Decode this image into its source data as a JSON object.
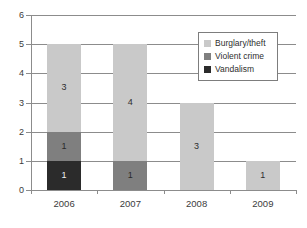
{
  "chart_data": {
    "type": "bar",
    "subtype": "stacked-bar",
    "title": "",
    "xlabel": "",
    "ylabel": "",
    "categories": [
      "2006",
      "2007",
      "2008",
      "2009"
    ],
    "series": [
      {
        "name": "Vandalism",
        "color": "#2b2b2b",
        "values": [
          1,
          0,
          0,
          0
        ]
      },
      {
        "name": "Violent crime",
        "color": "#7f7f7f",
        "values": [
          1,
          1,
          0,
          0
        ]
      },
      {
        "name": "Burglary/theft",
        "color": "#c9c9c9",
        "values": [
          3,
          4,
          3,
          1
        ]
      }
    ],
    "stack_order_bottom_to_top": [
      "Vandalism",
      "Violent crime",
      "Burglary/theft"
    ],
    "totals": [
      5,
      5,
      3,
      1
    ],
    "ylim": [
      0,
      6
    ],
    "yticks": [
      "0",
      "1",
      "2",
      "3",
      "4",
      "5",
      "6"
    ],
    "grid": true,
    "grid_axis": "y",
    "legend_position": "top-right",
    "data_labels": {
      "2006": [
        {
          "series": "Vandalism",
          "label": "1"
        },
        {
          "series": "Violent crime",
          "label": "1"
        },
        {
          "series": "Burglary/theft",
          "label": "3"
        }
      ],
      "2007": [
        {
          "series": "Violent crime",
          "label": "1"
        },
        {
          "series": "Burglary/theft",
          "label": "4"
        }
      ],
      "2008": [
        {
          "series": "Burglary/theft",
          "label": "3"
        }
      ],
      "2009": [
        {
          "series": "Burglary/theft",
          "label": "1"
        }
      ]
    }
  },
  "axes": {
    "y_labels": [
      "6",
      "5",
      "4",
      "3",
      "2",
      "1",
      "0"
    ],
    "x_labels": [
      "2006",
      "2007",
      "2008",
      "2009"
    ]
  },
  "legend": {
    "items": [
      {
        "label": "Burglary/theft",
        "color": "#c9c9c9"
      },
      {
        "label": "Violent crime",
        "color": "#7f7f7f"
      },
      {
        "label": "Vandalism",
        "color": "#2b2b2b"
      }
    ]
  },
  "bars": [
    {
      "category": "2006",
      "segments": [
        {
          "series": "Burglary/theft",
          "value": 3,
          "label": "3",
          "from": 2,
          "to": 5,
          "color": "#c9c9c9",
          "tone": "light"
        },
        {
          "series": "Violent crime",
          "value": 1,
          "label": "1",
          "from": 1,
          "to": 2,
          "color": "#7f7f7f",
          "tone": "mid"
        },
        {
          "series": "Vandalism",
          "value": 1,
          "label": "1",
          "from": 0,
          "to": 1,
          "color": "#2b2b2b",
          "tone": "dark"
        }
      ]
    },
    {
      "category": "2007",
      "segments": [
        {
          "series": "Burglary/theft",
          "value": 4,
          "label": "4",
          "from": 1,
          "to": 5,
          "color": "#c9c9c9",
          "tone": "light"
        },
        {
          "series": "Violent crime",
          "value": 1,
          "label": "1",
          "from": 0,
          "to": 1,
          "color": "#7f7f7f",
          "tone": "mid"
        }
      ]
    },
    {
      "category": "2008",
      "segments": [
        {
          "series": "Burglary/theft",
          "value": 3,
          "label": "3",
          "from": 0,
          "to": 3,
          "color": "#c9c9c9",
          "tone": "light"
        }
      ]
    },
    {
      "category": "2009",
      "segments": [
        {
          "series": "Burglary/theft",
          "value": 1,
          "label": "1",
          "from": 0,
          "to": 1,
          "color": "#c9c9c9",
          "tone": "light"
        }
      ]
    }
  ]
}
